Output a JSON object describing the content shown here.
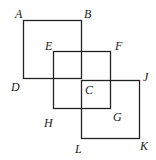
{
  "diagram": {
    "stroke_color": "#222222",
    "squares": [
      {
        "name": "ABCD",
        "x": 23,
        "y": 20,
        "size": 58
      },
      {
        "name": "EFGH",
        "x": 53,
        "y": 51,
        "size": 57
      },
      {
        "name": "CJKL",
        "x": 81,
        "y": 80,
        "size": 58
      }
    ],
    "labels": [
      {
        "text": "A",
        "x": 15,
        "y": 8
      },
      {
        "text": "B",
        "x": 84,
        "y": 8
      },
      {
        "text": "E",
        "x": 45,
        "y": 40
      },
      {
        "text": "F",
        "x": 115,
        "y": 40
      },
      {
        "text": "D",
        "x": 11,
        "y": 81
      },
      {
        "text": "C",
        "x": 85,
        "y": 84
      },
      {
        "text": "J",
        "x": 143,
        "y": 71
      },
      {
        "text": "H",
        "x": 44,
        "y": 117
      },
      {
        "text": "G",
        "x": 113,
        "y": 111
      },
      {
        "text": "L",
        "x": 75,
        "y": 143
      },
      {
        "text": "K",
        "x": 140,
        "y": 140
      }
    ]
  }
}
